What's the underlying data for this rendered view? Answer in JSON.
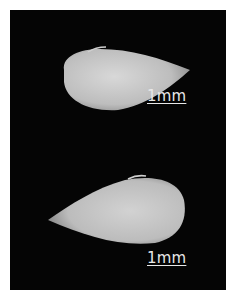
{
  "figure": {
    "background": "#050505",
    "frame": "#ffffff",
    "panels": [
      {
        "id": "top",
        "subject": "seed-grain",
        "orientation": "tip-right",
        "scale_label": "1mm"
      },
      {
        "id": "bottom",
        "subject": "seed-grain",
        "orientation": "tip-left",
        "scale_label": "1mm"
      }
    ]
  }
}
